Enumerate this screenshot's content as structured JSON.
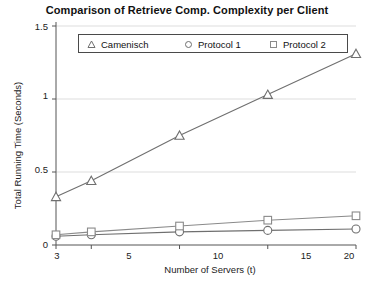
{
  "chart_data": {
    "type": "line",
    "title": "Comparison of Retrieve Comp. Complexity per Client",
    "xlabel": "Number of Servers (t)",
    "ylabel": "Total Running Time (Seconds)",
    "x": [
      3,
      5,
      10,
      15,
      20
    ],
    "xticklabels": [
      "3",
      "5",
      "10",
      "15",
      "20"
    ],
    "yticklabels": [
      "0",
      "0.5",
      "1",
      "1.5"
    ],
    "yticks": [
      0,
      0.5,
      1,
      1.5
    ],
    "xlim": [
      3,
      20
    ],
    "ylim": [
      0,
      1.5
    ],
    "grid": true,
    "legend_position": "top-center-inside",
    "series": [
      {
        "name": "Camenisch",
        "marker": "triangle",
        "color": "#6f6f6f",
        "values": [
          0.33,
          0.44,
          0.75,
          1.03,
          1.31
        ]
      },
      {
        "name": "Protocol 1",
        "marker": "circle",
        "color": "#6f6f6f",
        "values": [
          0.06,
          0.07,
          0.09,
          0.1,
          0.11
        ]
      },
      {
        "name": "Protocol 2",
        "marker": "square",
        "color": "#8a8a8a",
        "values": [
          0.07,
          0.09,
          0.13,
          0.17,
          0.2
        ]
      }
    ]
  },
  "legend": {
    "items": [
      {
        "label": "Camenisch",
        "marker": "triangle-marker-icon"
      },
      {
        "label": "Protocol 1",
        "marker": "circle-marker-icon"
      },
      {
        "label": "Protocol 2",
        "marker": "square-marker-icon"
      }
    ]
  },
  "axes": {
    "y_ticks": [
      "1.5",
      "1",
      "0.5",
      "0"
    ],
    "x_ticks": [
      "3",
      "5",
      "10",
      "15",
      "20"
    ]
  },
  "colors": {
    "axis": "#555555",
    "grid": "#dddddd",
    "series_dark": "#6f6f6f",
    "series_light": "#8a8a8a",
    "text": "#111111"
  }
}
